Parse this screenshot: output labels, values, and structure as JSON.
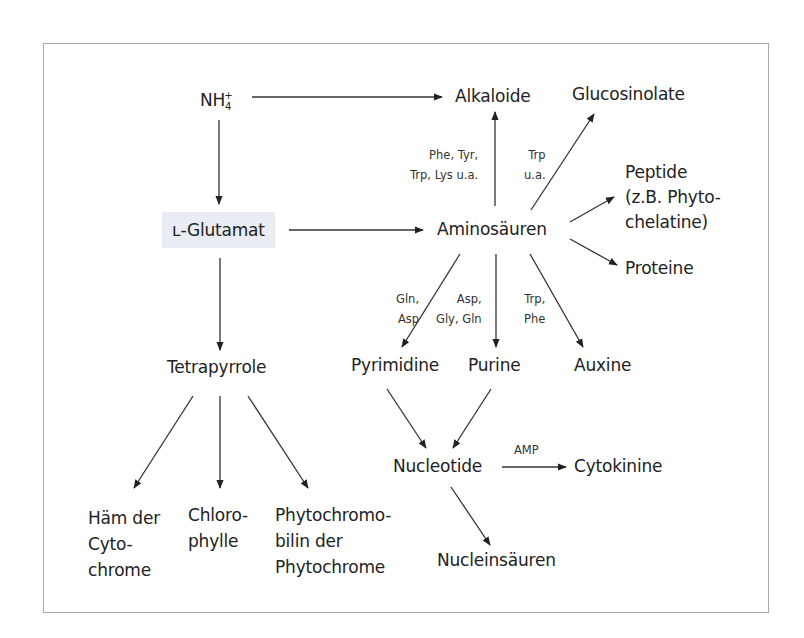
{
  "colors": {
    "frame": "#a8a8a8",
    "highlight_box": "#e9ecf3",
    "ink": "#222222"
  },
  "nodes": {
    "nh4": {
      "base": "NH",
      "sub": "4",
      "sup": "+"
    },
    "glutamat": "ʟ-Glutamat",
    "tetrapyrrole": "Tetrapyrrole",
    "alkaloide": "Alkaloide",
    "glucosinolate": "Glucosinolate",
    "aminosaeuren": "Aminosäuren",
    "peptide": "Peptide\n(z.B. Phyto-\nchelatine)",
    "proteine": "Proteine",
    "pyrimidine": "Pyrimidine",
    "purine": "Purine",
    "auxine": "Auxine",
    "nucleotide": "Nucleotide",
    "cytokinine": "Cytokinine",
    "nucleinsaeuren": "Nucleinsäuren",
    "haem": "Häm der\nCyto-\nchrome",
    "chlorophylle": "Chloro-\nphylle",
    "phytochromobilin": "Phytochromo-\nbilin der\nPhytochrome"
  },
  "edge_labels": {
    "to_alkaloide": "Phe, Tyr,\nTrp, Lys u.a.",
    "to_glucosinolate": "Trp\nu.a.",
    "to_pyrimidine": "Gln,\nAsp",
    "to_purine": "Asp,\nGly, Gln",
    "to_auxine": "Trp,\nPhe",
    "to_cytokinine": "AMP"
  },
  "edges": [
    [
      "NH4+",
      "Alkaloide"
    ],
    [
      "NH4+",
      "L-Glutamat"
    ],
    [
      "L-Glutamat",
      "Aminosäuren"
    ],
    [
      "L-Glutamat",
      "Tetrapyrrole"
    ],
    [
      "Aminosäuren",
      "Alkaloide"
    ],
    [
      "Aminosäuren",
      "Glucosinolate"
    ],
    [
      "Aminosäuren",
      "Peptide"
    ],
    [
      "Aminosäuren",
      "Proteine"
    ],
    [
      "Aminosäuren",
      "Pyrimidine"
    ],
    [
      "Aminosäuren",
      "Purine"
    ],
    [
      "Aminosäuren",
      "Auxine"
    ],
    [
      "Tetrapyrrole",
      "Häm der Cytochrome"
    ],
    [
      "Tetrapyrrole",
      "Chlorophylle"
    ],
    [
      "Tetrapyrrole",
      "Phytochromobilin der Phytochrome"
    ],
    [
      "Pyrimidine",
      "Nucleotide"
    ],
    [
      "Purine",
      "Nucleotide"
    ],
    [
      "Nucleotide",
      "Cytokinine"
    ],
    [
      "Nucleotide",
      "Nucleinsäuren"
    ]
  ]
}
